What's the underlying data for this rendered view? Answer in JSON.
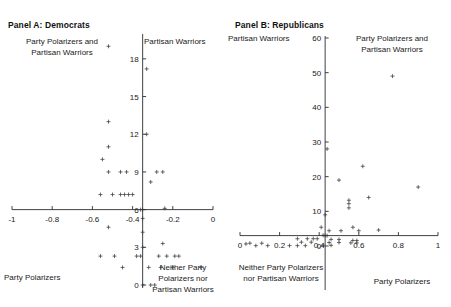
{
  "figure": {
    "background": "#ffffff",
    "marker_symbol": "plus",
    "axis_color": "#2b2b2b"
  },
  "panels": [
    {
      "id": "panel-a",
      "title": "Panel A: Democrats",
      "quadrant_labels": {
        "top_left": "Party Polarizers and\nPartisan Warriors",
        "top_right": "Partisan Warriors",
        "bottom_left": "Party Polarizers",
        "bottom_right": "Neither Party\nPolarizers nor\nPartisan Warriors"
      }
    },
    {
      "id": "panel-b",
      "title": "Panel B: Republicans",
      "quadrant_labels": {
        "top_left": "Partisan Warriors",
        "top_right": "Party Polarizers and\nPartisan Warriors",
        "bottom_left": "Neither Party Polarizers\nnor Partisan Warriors",
        "bottom_right": "Party Polarizers"
      }
    }
  ],
  "chart_data": [
    {
      "type": "scatter",
      "panel": "Panel A: Democrats",
      "title": "Panel A: Democrats",
      "xlabel": "",
      "ylabel": "",
      "xlim": [
        -1,
        0
      ],
      "ylim": [
        0,
        19.5
      ],
      "xticks": [
        -1,
        -0.8,
        -0.6,
        -0.4,
        -0.2,
        0
      ],
      "xticklabels": [
        "-1",
        "-0.8",
        "-0.6",
        "-0.4",
        "-0.2",
        "0"
      ],
      "yticks": [
        0,
        3,
        6,
        9,
        12,
        15,
        18
      ],
      "yticklabels": [
        "0",
        "3",
        "6",
        "9",
        "12",
        "15",
        "18"
      ],
      "grid": false,
      "legend": "none",
      "origin_crosshair": {
        "x": -0.35,
        "y": 6.0
      },
      "points": [
        {
          "x": -0.52,
          "y": 19.0
        },
        {
          "x": -0.33,
          "y": 17.2
        },
        {
          "x": -0.52,
          "y": 13.0
        },
        {
          "x": -0.52,
          "y": 11.0
        },
        {
          "x": -0.33,
          "y": 12.0
        },
        {
          "x": -0.55,
          "y": 10.0
        },
        {
          "x": -0.52,
          "y": 9.0
        },
        {
          "x": -0.46,
          "y": 9.0
        },
        {
          "x": -0.43,
          "y": 9.0
        },
        {
          "x": -0.28,
          "y": 9.0
        },
        {
          "x": -0.25,
          "y": 9.0
        },
        {
          "x": -0.31,
          "y": 8.2
        },
        {
          "x": -0.56,
          "y": 7.2
        },
        {
          "x": -0.5,
          "y": 7.2
        },
        {
          "x": -0.46,
          "y": 7.2
        },
        {
          "x": -0.44,
          "y": 7.2
        },
        {
          "x": -0.42,
          "y": 7.2
        },
        {
          "x": -0.4,
          "y": 7.2
        },
        {
          "x": -0.36,
          "y": 6.0
        },
        {
          "x": -0.35,
          "y": 6.0
        },
        {
          "x": -0.24,
          "y": 6.1
        },
        {
          "x": -0.35,
          "y": 5.3
        },
        {
          "x": -0.52,
          "y": 4.6
        },
        {
          "x": -0.35,
          "y": 4.2
        },
        {
          "x": -0.25,
          "y": 3.3
        },
        {
          "x": -0.35,
          "y": 3.0
        },
        {
          "x": -0.56,
          "y": 2.3
        },
        {
          "x": -0.49,
          "y": 2.3
        },
        {
          "x": -0.38,
          "y": 2.3
        },
        {
          "x": -0.36,
          "y": 2.3
        },
        {
          "x": -0.27,
          "y": 2.3
        },
        {
          "x": -0.23,
          "y": 2.3
        },
        {
          "x": -0.19,
          "y": 2.3
        },
        {
          "x": -0.17,
          "y": 2.3
        },
        {
          "x": -0.45,
          "y": 1.4
        },
        {
          "x": -0.32,
          "y": 1.4
        },
        {
          "x": -0.26,
          "y": 1.4
        },
        {
          "x": -0.2,
          "y": 1.4
        },
        {
          "x": -0.06,
          "y": 1.4
        },
        {
          "x": -0.35,
          "y": 0.0
        },
        {
          "x": -0.31,
          "y": 0.0
        },
        {
          "x": -0.29,
          "y": 0.0
        }
      ]
    },
    {
      "type": "scatter",
      "panel": "Panel B: Republicans",
      "title": "Panel B: Republicans",
      "xlabel": "",
      "ylabel": "",
      "xlim": [
        0,
        1
      ],
      "ylim": [
        0,
        60
      ],
      "xticks": [
        0,
        0.2,
        0.4,
        0.6,
        0.8,
        1
      ],
      "xticklabels": [
        "0",
        "0.2",
        "0.4",
        "0.6",
        "0.8",
        "1"
      ],
      "yticks": [
        0,
        10,
        20,
        30,
        40,
        50,
        60
      ],
      "yticklabels": [
        "0",
        "10",
        "20",
        "30",
        "40",
        "50",
        "60"
      ],
      "grid": false,
      "legend": "none",
      "origin_crosshair": {
        "x": 0.43,
        "y": 3.0
      },
      "points": [
        {
          "x": 0.77,
          "y": 49.0
        },
        {
          "x": 0.44,
          "y": 28.0
        },
        {
          "x": 0.62,
          "y": 23.0
        },
        {
          "x": 0.5,
          "y": 19.0
        },
        {
          "x": 0.9,
          "y": 17.0
        },
        {
          "x": 0.65,
          "y": 14.0
        },
        {
          "x": 0.55,
          "y": 13.2
        },
        {
          "x": 0.55,
          "y": 12.2
        },
        {
          "x": 0.55,
          "y": 11.0
        },
        {
          "x": 0.43,
          "y": 9.0
        },
        {
          "x": 0.41,
          "y": 5.4
        },
        {
          "x": 0.57,
          "y": 5.4
        },
        {
          "x": 0.7,
          "y": 4.6
        },
        {
          "x": 0.45,
          "y": 4.4
        },
        {
          "x": 0.51,
          "y": 4.4
        },
        {
          "x": 0.6,
          "y": 4.4
        },
        {
          "x": 0.42,
          "y": 3.1
        },
        {
          "x": 0.43,
          "y": 3.0
        },
        {
          "x": 0.44,
          "y": 3.0
        },
        {
          "x": 0.29,
          "y": 2.1
        },
        {
          "x": 0.34,
          "y": 2.1
        },
        {
          "x": 0.37,
          "y": 2.1
        },
        {
          "x": 0.39,
          "y": 2.1
        },
        {
          "x": 0.46,
          "y": 1.9
        },
        {
          "x": 0.5,
          "y": 1.9
        },
        {
          "x": 0.57,
          "y": 1.6
        },
        {
          "x": 0.59,
          "y": 1.6
        },
        {
          "x": 0.31,
          "y": 1.1
        },
        {
          "x": 0.36,
          "y": 1.1
        },
        {
          "x": 0.45,
          "y": 1.0
        },
        {
          "x": 0.5,
          "y": 1.0
        },
        {
          "x": 0.56,
          "y": 0.9
        },
        {
          "x": 0.59,
          "y": 0.9
        },
        {
          "x": 0.03,
          "y": 0.6
        },
        {
          "x": 0.08,
          "y": 0.1
        },
        {
          "x": 0.14,
          "y": 0.1
        },
        {
          "x": 0.05,
          "y": 0.8
        },
        {
          "x": 0.11,
          "y": 0.8
        },
        {
          "x": 0.25,
          "y": 0.1
        },
        {
          "x": 0.29,
          "y": 0.1
        },
        {
          "x": 0.33,
          "y": 0.1
        },
        {
          "x": 0.42,
          "y": 0.2
        },
        {
          "x": 0.46,
          "y": 0.2
        }
      ]
    }
  ]
}
